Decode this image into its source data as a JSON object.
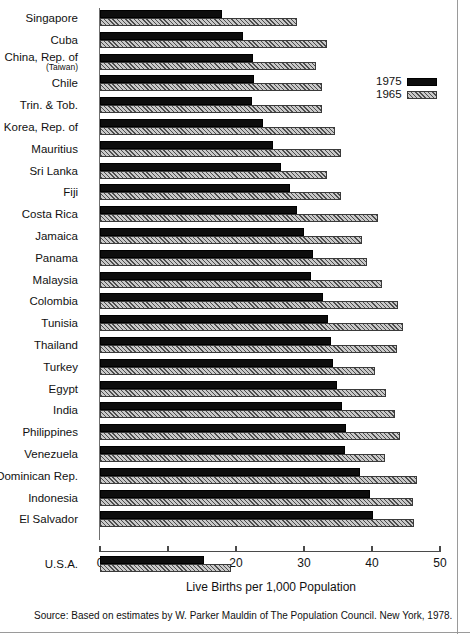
{
  "chart_data": {
    "type": "bar",
    "orientation": "horizontal",
    "title": "",
    "xlabel": "Live Births per 1,000 Population",
    "ylabel": "",
    "xlim": [
      0,
      50
    ],
    "xticks": [
      0,
      10,
      20,
      30,
      40,
      50
    ],
    "grid": false,
    "legend_position": "top-right",
    "legend": [
      "1975",
      "1965"
    ],
    "categories": [
      "Singapore",
      "Cuba",
      "China, Rep. of",
      "Chile",
      "Trin. & Tob.",
      "Korea, Rep. of",
      "Mauritius",
      "Sri Lanka",
      "Fiji",
      "Costa Rica",
      "Jamaica",
      "Panama",
      "Malaysia",
      "Colombia",
      "Tunisia",
      "Thailand",
      "Turkey",
      "Egypt",
      "India",
      "Philippines",
      "Venezuela",
      "Dominican Rep.",
      "Indonesia",
      "El Salvador",
      "U.S.A."
    ],
    "category_sublabels": {
      "China, Rep. of": "(Taiwan)"
    },
    "series": [
      {
        "name": "1975",
        "color": "#0d0d0d",
        "values": [
          17.9,
          21.0,
          22.5,
          22.7,
          22.4,
          24.0,
          25.4,
          26.6,
          27.9,
          28.9,
          30.0,
          31.3,
          31.1,
          32.8,
          33.6,
          34.0,
          34.2,
          34.8,
          35.6,
          36.2,
          36.0,
          38.2,
          39.7,
          40.2,
          15.3
        ]
      },
      {
        "name": "1965",
        "color": "#c9c9c9",
        "values": [
          29.0,
          33.4,
          31.8,
          32.7,
          32.7,
          34.6,
          35.5,
          33.4,
          35.4,
          40.9,
          38.5,
          39.2,
          41.4,
          43.8,
          44.5,
          43.7,
          40.5,
          42.0,
          43.4,
          44.1,
          41.9,
          46.6,
          46.0,
          46.2,
          19.3
        ]
      }
    ],
    "source": "Source:  Based on estimates by W. Parker Mauldin of The Population Council. New York, 1978."
  }
}
